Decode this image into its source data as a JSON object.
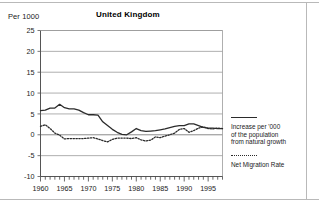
{
  "figure": {
    "unit_label": "Per 1000",
    "title": "United Kingdom"
  },
  "legend": {
    "series1_label": "Increase per '000\nof the population\nfrom natural growth",
    "series2_label": "Net Migration Rate"
  },
  "chart_data": {
    "type": "line",
    "title": "United Kingdom",
    "subtitle": "",
    "xlabel": "",
    "ylabel": "Per 1000",
    "xlim": [
      1960,
      1998
    ],
    "ylim": [
      -10,
      25
    ],
    "yticks": [
      -10,
      -5,
      0,
      5,
      10,
      15,
      20,
      25
    ],
    "xticks": [
      1960,
      1965,
      1970,
      1975,
      1980,
      1985,
      1990,
      1995
    ],
    "xtick_minor_step": 1,
    "grid": "horizontal",
    "legend_position": "right",
    "x": [
      1960,
      1961,
      1962,
      1963,
      1964,
      1965,
      1966,
      1967,
      1968,
      1969,
      1970,
      1971,
      1972,
      1973,
      1974,
      1975,
      1976,
      1977,
      1978,
      1979,
      1980,
      1981,
      1982,
      1983,
      1984,
      1985,
      1986,
      1987,
      1988,
      1989,
      1990,
      1991,
      1992,
      1993,
      1994,
      1995,
      1996,
      1997,
      1998
    ],
    "series": [
      {
        "name": "Increase per '000 of the population from natural growth",
        "style": "solid",
        "color": "#2b2b2b",
        "values": [
          5.8,
          5.9,
          6.4,
          6.4,
          7.3,
          6.5,
          6.2,
          6.2,
          5.9,
          5.3,
          4.8,
          4.8,
          4.7,
          3.1,
          2.2,
          1.3,
          0.6,
          0.1,
          0.0,
          0.7,
          1.5,
          1.0,
          0.8,
          0.9,
          1.0,
          1.2,
          1.4,
          1.7,
          2.0,
          2.2,
          2.2,
          2.6,
          2.6,
          2.2,
          1.8,
          1.6,
          1.6,
          1.5,
          1.5
        ]
      },
      {
        "name": "Net Migration Rate",
        "style": "dotted",
        "color": "#2b2b2b",
        "values": [
          2.0,
          2.4,
          1.5,
          0.4,
          -0.1,
          -1.0,
          -0.9,
          -0.9,
          -0.9,
          -0.9,
          -0.8,
          -0.7,
          -1.0,
          -1.4,
          -1.7,
          -1.1,
          -0.8,
          -0.8,
          -0.8,
          -0.9,
          -0.7,
          -1.2,
          -1.5,
          -1.3,
          -0.5,
          -0.7,
          -0.3,
          0.0,
          0.4,
          1.3,
          1.5,
          0.6,
          1.0,
          1.6,
          1.9,
          1.5,
          1.4,
          1.6,
          1.5
        ]
      }
    ]
  }
}
